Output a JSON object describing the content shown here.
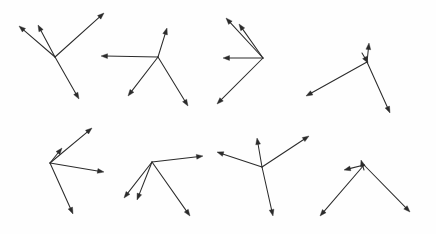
{
  "page": {
    "width": 436,
    "height": 234,
    "background_color": "#fefefe",
    "stroke_color": "#2b2b2b",
    "stroke_width": 1.05,
    "arrowhead_length": 6.5,
    "arrowhead_half_width": 2.4,
    "figure_count": 8,
    "layout": "2 rows x 4 columns of radial arrow clusters"
  },
  "figures": [
    {
      "id": "figure-1",
      "label": "cluster-top-row-1",
      "row": 1,
      "column": 1,
      "hub": {
        "x": 55,
        "y": 57
      },
      "arrow_count": 4,
      "arrows": [
        {
          "name": "arrow-up-left",
          "x1": 55,
          "y1": 57,
          "x2": 19,
          "y2": 26,
          "tip": true
        },
        {
          "name": "arrow-up-mid",
          "x1": 55,
          "y1": 57,
          "x2": 38,
          "y2": 25,
          "tip": true
        },
        {
          "name": "arrow-up-right",
          "x1": 55,
          "y1": 57,
          "x2": 104,
          "y2": 13,
          "tip": true
        },
        {
          "name": "arrow-down-right",
          "x1": 55,
          "y1": 57,
          "x2": 79,
          "y2": 99,
          "tip": true
        }
      ]
    },
    {
      "id": "figure-2",
      "label": "cluster-top-row-2",
      "row": 1,
      "column": 2,
      "hub": {
        "x": 158,
        "y": 57
      },
      "arrow_count": 4,
      "arrows": [
        {
          "name": "arrow-left",
          "x1": 158,
          "y1": 57,
          "x2": 101,
          "y2": 56,
          "tip": true
        },
        {
          "name": "arrow-up-right",
          "x1": 158,
          "y1": 57,
          "x2": 167,
          "y2": 28,
          "tip": true
        },
        {
          "name": "arrow-down-left",
          "x1": 158,
          "y1": 57,
          "x2": 128,
          "y2": 96,
          "tip": true
        },
        {
          "name": "arrow-down-right",
          "x1": 158,
          "y1": 57,
          "x2": 188,
          "y2": 106,
          "tip": true
        }
      ]
    },
    {
      "id": "figure-3",
      "label": "cluster-top-row-3",
      "row": 1,
      "column": 3,
      "hub": {
        "x": 263,
        "y": 58
      },
      "arrow_count": 4,
      "arrows": [
        {
          "name": "arrow-up-left-outer",
          "x1": 263,
          "y1": 58,
          "x2": 226,
          "y2": 18,
          "tip": true
        },
        {
          "name": "arrow-up-left-inner",
          "x1": 263,
          "y1": 58,
          "x2": 239,
          "y2": 24,
          "tip": true
        },
        {
          "name": "arrow-left",
          "x1": 263,
          "y1": 58,
          "x2": 223,
          "y2": 58,
          "tip": true
        },
        {
          "name": "arrow-down-left",
          "x1": 263,
          "y1": 58,
          "x2": 217,
          "y2": 104,
          "tip": true
        }
      ]
    },
    {
      "id": "figure-4",
      "label": "cluster-top-row-4",
      "row": 1,
      "column": 4,
      "hub": {
        "x": 367,
        "y": 62
      },
      "arrow_count": 4,
      "arrows": [
        {
          "name": "arrow-up",
          "x1": 367,
          "y1": 62,
          "x2": 369,
          "y2": 43,
          "tip": true
        },
        {
          "name": "arrow-down-short",
          "x1": 362,
          "y1": 53,
          "x2": 368,
          "y2": 63,
          "tip": true
        },
        {
          "name": "arrow-down-left-long",
          "x1": 367,
          "y1": 62,
          "x2": 306,
          "y2": 96,
          "tip": true
        },
        {
          "name": "arrow-down-right-long",
          "x1": 367,
          "y1": 62,
          "x2": 390,
          "y2": 113,
          "tip": true
        }
      ]
    },
    {
      "id": "figure-5",
      "label": "cluster-bottom-row-1",
      "row": 2,
      "column": 1,
      "hub": {
        "x": 50,
        "y": 163
      },
      "arrow_count": 4,
      "arrows": [
        {
          "name": "arrow-up-right-long",
          "x1": 50,
          "y1": 163,
          "x2": 92,
          "y2": 128,
          "tip": true
        },
        {
          "name": "arrow-up-right-short",
          "x1": 50,
          "y1": 163,
          "x2": 62,
          "y2": 148,
          "tip": true
        },
        {
          "name": "arrow-right",
          "x1": 50,
          "y1": 163,
          "x2": 104,
          "y2": 172,
          "tip": true
        },
        {
          "name": "arrow-down-right",
          "x1": 50,
          "y1": 163,
          "x2": 73,
          "y2": 214,
          "tip": true
        }
      ]
    },
    {
      "id": "figure-6",
      "label": "cluster-bottom-row-2",
      "row": 2,
      "column": 2,
      "hub": {
        "x": 152,
        "y": 162
      },
      "arrow_count": 4,
      "arrows": [
        {
          "name": "arrow-right-long",
          "x1": 152,
          "y1": 162,
          "x2": 203,
          "y2": 156,
          "tip": true
        },
        {
          "name": "arrow-down-left-outer",
          "x1": 152,
          "y1": 162,
          "x2": 124,
          "y2": 198,
          "tip": true
        },
        {
          "name": "arrow-down-left-inner",
          "x1": 152,
          "y1": 162,
          "x2": 137,
          "y2": 200,
          "tip": true
        },
        {
          "name": "arrow-down-right",
          "x1": 152,
          "y1": 162,
          "x2": 190,
          "y2": 216,
          "tip": true
        }
      ]
    },
    {
      "id": "figure-7",
      "label": "cluster-bottom-row-3",
      "row": 2,
      "column": 3,
      "hub": {
        "x": 262,
        "y": 167
      },
      "arrow_count": 4,
      "arrows": [
        {
          "name": "arrow-up",
          "x1": 262,
          "y1": 167,
          "x2": 257,
          "y2": 138,
          "tip": true
        },
        {
          "name": "arrow-up-right",
          "x1": 262,
          "y1": 167,
          "x2": 309,
          "y2": 136,
          "tip": true
        },
        {
          "name": "arrow-up-left",
          "x1": 262,
          "y1": 167,
          "x2": 217,
          "y2": 152,
          "tip": true
        },
        {
          "name": "arrow-down-right",
          "x1": 262,
          "y1": 167,
          "x2": 273,
          "y2": 216,
          "tip": true
        }
      ]
    },
    {
      "id": "figure-8",
      "label": "cluster-bottom-row-4",
      "row": 2,
      "column": 4,
      "hub": {
        "x": 364,
        "y": 165
      },
      "arrow_count": 4,
      "arrows": [
        {
          "name": "arrow-left-short",
          "x1": 364,
          "y1": 165,
          "x2": 344,
          "y2": 170,
          "tip": true
        },
        {
          "name": "arrow-up-short",
          "x1": 364,
          "y1": 170,
          "x2": 361,
          "y2": 160,
          "tip": true
        },
        {
          "name": "arrow-down-left-long",
          "x1": 364,
          "y1": 165,
          "x2": 320,
          "y2": 216,
          "tip": true
        },
        {
          "name": "arrow-down-right-long",
          "x1": 364,
          "y1": 165,
          "x2": 410,
          "y2": 212,
          "tip": true
        }
      ]
    }
  ]
}
